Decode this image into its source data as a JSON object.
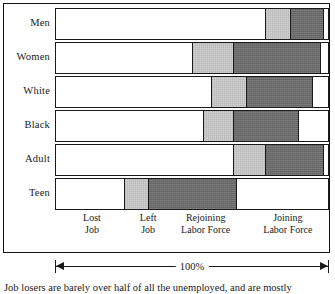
{
  "figure": {
    "caption": "Job losers are barely over half of all the unemployed, and are mostly",
    "scale_label": "100%"
  },
  "axis": {
    "group_labels": [
      {
        "line1": "Lost",
        "line2": "Job",
        "center_pct": 13.5
      },
      {
        "line1": "Left",
        "line2": "Job",
        "center_pct": 34.0
      },
      {
        "line1": "Rejoining",
        "line2": "Labor Force",
        "center_pct": 55.0
      },
      {
        "line1": "Joining",
        "line2": "Labor Force",
        "center_pct": 85.0
      }
    ]
  },
  "chart_data": {
    "type": "bar",
    "orientation": "horizontal",
    "stacked": true,
    "normalized": true,
    "title": "",
    "xlabel": "",
    "ylabel": "",
    "xlim": [
      0,
      100
    ],
    "grid": false,
    "legend_position": "below-axis",
    "categories": [
      "Men",
      "Women",
      "White",
      "Black",
      "Adult",
      "Teen"
    ],
    "series": [
      {
        "name": "Lost Job",
        "fill": "#ffffff",
        "values": [
          77,
          50,
          57,
          54,
          65,
          25
        ]
      },
      {
        "name": "Left Job",
        "fill": "#c8c8c8",
        "values": [
          9,
          15,
          13,
          11,
          12,
          9
        ]
      },
      {
        "name": "Rejoining Labor Force",
        "fill": "#696969",
        "values": [
          12,
          32,
          24,
          24,
          21,
          32
        ]
      },
      {
        "name": "Joining Labor Force",
        "fill": "#ffffff",
        "values": [
          2,
          3,
          6,
          11,
          2,
          34
        ]
      }
    ]
  },
  "colors": {
    "ink": "#1a1a1a",
    "segment_light": "#c8c8c8",
    "segment_dark": "#696969",
    "segment_empty": "#ffffff",
    "page": "#ffffff"
  }
}
